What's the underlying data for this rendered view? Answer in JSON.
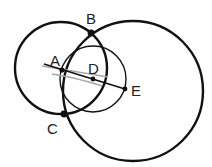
{
  "diagram": {
    "type": "geometric construction",
    "points": [
      {
        "id": "A",
        "label": "A"
      },
      {
        "id": "B",
        "label": "B"
      },
      {
        "id": "C",
        "label": "C"
      },
      {
        "id": "D",
        "label": "D"
      },
      {
        "id": "E",
        "label": "E"
      }
    ],
    "circles": [
      {
        "id": "circle-left",
        "description": "circle through B and C"
      },
      {
        "id": "circle-big",
        "description": "large circle through B and C"
      },
      {
        "id": "circle-D",
        "description": "circle centered at D through A and E"
      }
    ],
    "segments": [
      {
        "id": "line-AE",
        "description": "line through A, D and E"
      }
    ],
    "colors": {
      "stroke": "#111111",
      "guide": "#a0a0a0",
      "background": "#ffffff"
    }
  }
}
